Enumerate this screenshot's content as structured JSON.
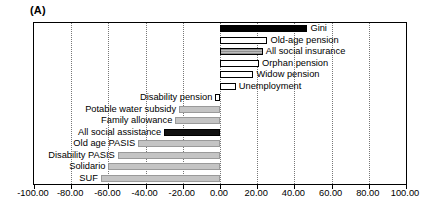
{
  "panel": {
    "label": "(A)"
  },
  "chart_data": {
    "type": "bar",
    "orientation": "horizontal",
    "title": "(A)",
    "xlabel": "",
    "ylabel": "",
    "xlim": [
      -100.0,
      100.0
    ],
    "xticks": [
      -100.0,
      -80.0,
      -60.0,
      -40.0,
      -20.0,
      0.0,
      20.0,
      40.0,
      60.0,
      80.0,
      100.0
    ],
    "xtick_labels": [
      "-100.00",
      "-80.00",
      "-60.00",
      "-40.00",
      "-20.00",
      "0.00",
      "20.00",
      "40.00",
      "60.00",
      "80.00",
      "100.00"
    ],
    "grid": true,
    "grid_style": "dotted-vertical",
    "legend": "none",
    "categories": [
      "Gini",
      "Old-age pension",
      "All social insurance",
      "Orphan pension",
      "Widow pension",
      "Unemployment",
      "Disability pension",
      "Potable water subsidy",
      "Family allowance",
      "All social assistance",
      "Old age PASIS",
      "Disability PASIS",
      "Solidario",
      "SUF"
    ],
    "values": [
      47.0,
      25.5,
      23.0,
      21.0,
      18.0,
      8.5,
      -2.5,
      -22.0,
      -24.0,
      -30.0,
      -44.0,
      -55.0,
      -60.0,
      -64.0
    ],
    "bar_styles": [
      "solid-black",
      "open",
      "hatch-mid",
      "open",
      "open",
      "open",
      "open",
      "light-grey",
      "light-grey",
      "solid-dark",
      "light-grey",
      "light-grey",
      "light-grey",
      "light-grey"
    ]
  }
}
